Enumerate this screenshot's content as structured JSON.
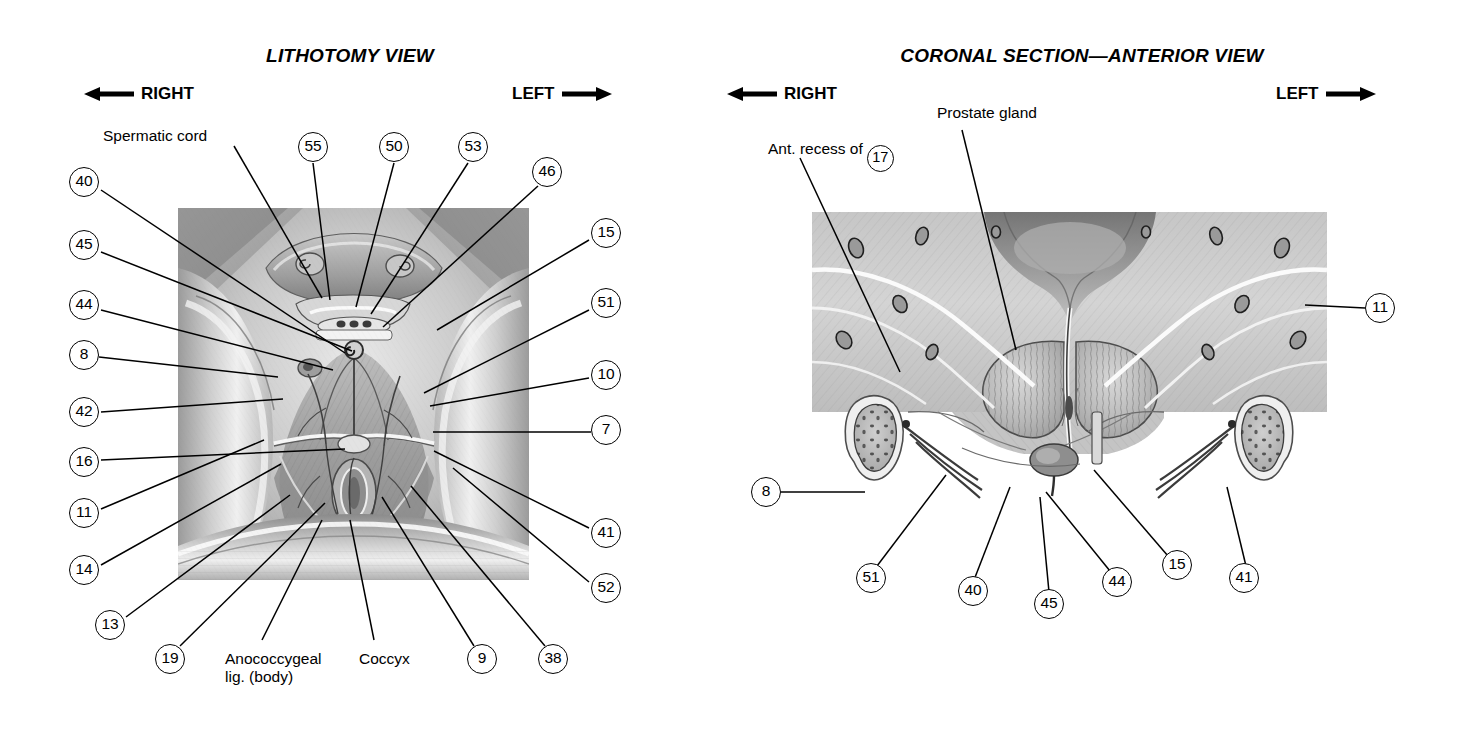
{
  "page": {
    "width": 1464,
    "height": 734,
    "background": "#ffffff",
    "ink": "#000000"
  },
  "panels": [
    {
      "id": "lithotomy",
      "title": "LITHOTOMY VIEW",
      "direction_left": {
        "label": "RIGHT",
        "arrow": "left-arrow-icon"
      },
      "direction_right": {
        "label": "LEFT",
        "arrow": "right-arrow-icon"
      },
      "artwork": {
        "name": "perineum-lithotomy-dissection",
        "description": "Grayscale anatomical dissection of the male perineum in lithotomy position",
        "x": 178,
        "y": 208,
        "width": 351,
        "height": 372
      },
      "text_labels": [
        {
          "name": "spermatic-cord",
          "text": "Spermatic cord",
          "x": 103,
          "y": 135
        },
        {
          "name": "anococcygeal-ligament",
          "text": "Anococcygeal",
          "text2": "lig. (body)",
          "x": 225,
          "y": 650
        },
        {
          "name": "coccyx",
          "text": "Coccyx",
          "x": 359,
          "y": 650
        }
      ],
      "callouts": [
        {
          "number": "55",
          "cx": 313,
          "cy": 147,
          "tx": 330,
          "ty": 300
        },
        {
          "number": "50",
          "cx": 394,
          "cy": 147,
          "tx": 356,
          "ty": 307
        },
        {
          "number": "53",
          "cx": 473,
          "cy": 147,
          "tx": 371,
          "ty": 314
        },
        {
          "number": "46",
          "cx": 547,
          "cy": 172,
          "tx": 383,
          "ty": 327
        },
        {
          "number": "40",
          "cx": 84,
          "cy": 182,
          "tx": 345,
          "ty": 353
        },
        {
          "number": "45",
          "cx": 84,
          "cy": 245,
          "tx": 352,
          "ty": 351
        },
        {
          "number": "44",
          "cx": 84,
          "cy": 305,
          "tx": 333,
          "ty": 370
        },
        {
          "number": "8",
          "cx": 84,
          "cy": 355,
          "tx": 278,
          "ty": 377
        },
        {
          "number": "42",
          "cx": 84,
          "cy": 412,
          "tx": 283,
          "ty": 399
        },
        {
          "number": "16",
          "cx": 84,
          "cy": 462,
          "tx": 345,
          "ty": 449
        },
        {
          "number": "11",
          "cx": 84,
          "cy": 513,
          "tx": 264,
          "ty": 440
        },
        {
          "number": "14",
          "cx": 84,
          "cy": 570,
          "tx": 281,
          "ty": 464
        },
        {
          "number": "13",
          "cx": 110,
          "cy": 625,
          "tx": 290,
          "ty": 495
        },
        {
          "number": "19",
          "cx": 170,
          "cy": 659,
          "tx": 325,
          "ty": 503
        },
        {
          "number": "9",
          "cx": 482,
          "cy": 659,
          "tx": 382,
          "ty": 497
        },
        {
          "number": "38",
          "cx": 553,
          "cy": 659,
          "tx": 411,
          "ty": 486
        },
        {
          "number": "15",
          "cx": 606,
          "cy": 233,
          "tx": 437,
          "ty": 330
        },
        {
          "number": "51",
          "cx": 606,
          "cy": 303,
          "tx": 424,
          "ty": 393
        },
        {
          "number": "10",
          "cx": 606,
          "cy": 375,
          "tx": 430,
          "ty": 406
        },
        {
          "number": "7",
          "cx": 606,
          "cy": 430,
          "tx": 433,
          "ty": 432
        },
        {
          "number": "41",
          "cx": 606,
          "cy": 533,
          "tx": 434,
          "ty": 451
        },
        {
          "number": "52",
          "cx": 606,
          "cy": 588,
          "tx": 453,
          "ty": 468
        }
      ]
    },
    {
      "id": "coronal",
      "title": "CORONAL SECTION—ANTERIOR VIEW",
      "direction_left": {
        "label": "RIGHT",
        "arrow": "left-arrow-icon"
      },
      "direction_right": {
        "label": "LEFT",
        "arrow": "right-arrow-icon"
      },
      "artwork": {
        "name": "prostate-coronal-section",
        "description": "Grayscale coronal section through the prostate gland and pelvic floor, anterior view",
        "x": 812,
        "y": 212,
        "width": 515,
        "height": 290
      },
      "text_labels": [
        {
          "name": "anterior-recess-of",
          "text": "Ant. recess of",
          "number": "17",
          "x": 768,
          "y": 140
        },
        {
          "name": "prostate-gland",
          "text": "Prostate gland",
          "x": 937,
          "y": 112
        }
      ],
      "callouts": [
        {
          "number": "11",
          "cx": 1380,
          "cy": 308,
          "tx": 1305,
          "ty": 305
        },
        {
          "number": "8",
          "cx": 766,
          "cy": 492,
          "tx": 865,
          "ty": 492
        },
        {
          "number": "51",
          "cx": 871,
          "cy": 578,
          "tx": 946,
          "ty": 475
        },
        {
          "number": "40",
          "cx": 973,
          "cy": 591,
          "tx": 1010,
          "ty": 487
        },
        {
          "number": "45",
          "cx": 1049,
          "cy": 604,
          "tx": 1040,
          "ty": 493
        },
        {
          "number": "44",
          "cx": 1117,
          "cy": 582,
          "tx": 1045,
          "ty": 490
        },
        {
          "number": "15",
          "cx": 1177,
          "cy": 565,
          "tx": 1094,
          "ty": 470
        },
        {
          "number": "41",
          "cx": 1244,
          "cy": 578,
          "tx": 1226,
          "ty": 485
        }
      ]
    }
  ]
}
